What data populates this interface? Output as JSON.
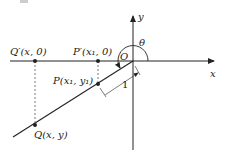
{
  "labels": {
    "y_axis": "y",
    "x_axis": "x",
    "theta": "θ",
    "origin": "O",
    "q_prime": "Q′(x, 0)",
    "p_prime": "P′(x₁, 0)",
    "p": "P(x₁, y₁)",
    "q": "Q(x, y)",
    "unit_length": "1"
  },
  "colors": {
    "stroke": "#222222",
    "dash": "#555555"
  }
}
